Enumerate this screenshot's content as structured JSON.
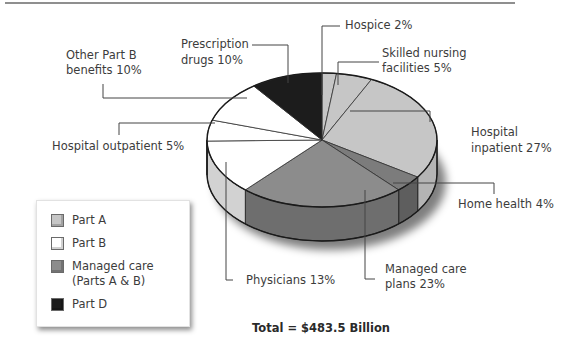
{
  "chart_data": {
    "type": "pie",
    "title": "",
    "total_label": "Total = $483.5 Billion",
    "slices": [
      {
        "label": "Hospice",
        "value": 2,
        "group": "Part A",
        "display": "Hospice 2%"
      },
      {
        "label": "Skilled nursing facilities",
        "value": 5,
        "group": "Part A",
        "display": "Skilled nursing facilities 5%"
      },
      {
        "label": "Hospital inpatient",
        "value": 27,
        "group": "Part A",
        "display": "Hospital inpatient 27%"
      },
      {
        "label": "Home health",
        "value": 4,
        "group": "Part A",
        "display": "Home health 4%"
      },
      {
        "label": "Managed care plans",
        "value": 23,
        "group": "Managed care (Parts A & B)",
        "display": "Managed care plans 23%"
      },
      {
        "label": "Physicians",
        "value": 13,
        "group": "Part B",
        "display": "Physicians 13%"
      },
      {
        "label": "Hospital outpatient",
        "value": 5,
        "group": "Part B",
        "display": "Hospital outpatient 5%"
      },
      {
        "label": "Other Part B benefits",
        "value": 10,
        "group": "Part B",
        "display": "Other Part B benefits 10%"
      },
      {
        "label": "Prescription drugs",
        "value": 10,
        "group": "Part D",
        "display": "Prescription drugs 10%"
      }
    ],
    "legend": [
      {
        "label": "Part A",
        "color": "#c8c8c8"
      },
      {
        "label": "Part B",
        "color": "#ffffff"
      },
      {
        "label": "Managed care (Parts A & B)",
        "color": "#8a8a8a"
      },
      {
        "label": "Part D",
        "color": "#1e1e1e"
      }
    ],
    "legend_position": "bottom-left",
    "unit": "%"
  },
  "labels": {
    "hospice": "Hospice 2%",
    "snf_line1": "Skilled nursing",
    "snf_line2": "facilities 5%",
    "inpatient_line1": "Hospital",
    "inpatient_line2": "inpatient 27%",
    "home_health": "Home health 4%",
    "managed_line1": "Managed care",
    "managed_line2": "plans 23%",
    "physicians": "Physicians 13%",
    "outpatient": "Hospital outpatient 5%",
    "other_b_line1": "Other Part B",
    "other_b_line2": "benefits 10%",
    "rx_line1": "Prescription",
    "rx_line2": "drugs 10%"
  },
  "legend": {
    "part_a": "Part A",
    "part_b": "Part B",
    "managed_line1": "Managed care",
    "managed_line2": "(Parts A & B)",
    "part_d": "Part D"
  },
  "colors": {
    "part_a_top": "#c6c6c6",
    "part_a_side": "#b4b4b4",
    "part_b_top": "#ffffff",
    "part_b_side": "#d2d2d2",
    "managed_top": "#8c8c8c",
    "managed_side": "#6e6e6e",
    "home_health_top": "#7c7c7c",
    "part_d_top": "#1c1c1c",
    "outline": "#1a1a1a",
    "leader": "#444444"
  },
  "total": "Total = $483.5 Billion"
}
